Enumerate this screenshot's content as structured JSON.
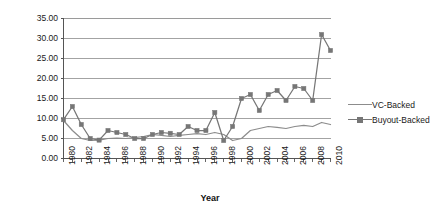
{
  "chart_data": {
    "type": "line",
    "title": "",
    "xlabel": "Year",
    "ylabel": "Median Age at IPO (Yrs)",
    "xlim": [
      1980,
      2010
    ],
    "ylim": [
      0,
      35
    ],
    "ytick_step": 5,
    "xtick_step": 2,
    "grid": "horizontal",
    "legend_position": "right",
    "ytick_labels": [
      "35.00",
      "30.00",
      "25.00",
      "20.00",
      "15.00",
      "10.00",
      "5.00",
      "0.00"
    ],
    "ytick_values": [
      35,
      30,
      25,
      20,
      15,
      10,
      5,
      0
    ],
    "xtick_labels": [
      "1980",
      "1982",
      "1984",
      "1986",
      "1988",
      "1990",
      "1992",
      "1994",
      "1996",
      "1998",
      "2000",
      "2002",
      "2004",
      "2006",
      "2008",
      "2010"
    ],
    "xtick_values": [
      1980,
      1982,
      1984,
      1986,
      1988,
      1990,
      1992,
      1994,
      1996,
      1998,
      2000,
      2002,
      2004,
      2006,
      2008,
      2010
    ],
    "x": [
      1980,
      1981,
      1982,
      1983,
      1984,
      1985,
      1986,
      1987,
      1988,
      1989,
      1990,
      1991,
      1992,
      1993,
      1994,
      1995,
      1996,
      1997,
      1998,
      1999,
      2000,
      2001,
      2002,
      2003,
      2004,
      2005,
      2006,
      2007,
      2008,
      2009,
      2010
    ],
    "series": [
      {
        "name": "VC-Backed",
        "color": "#8c8c8c",
        "marker": "none",
        "values": [
          9.5,
          7.0,
          5.0,
          4.5,
          4.6,
          5.0,
          5.1,
          5.0,
          5.2,
          5.5,
          6.0,
          5.8,
          5.5,
          5.8,
          6.0,
          6.2,
          6.0,
          6.5,
          6.0,
          4.5,
          5.0,
          7.0,
          7.5,
          8.0,
          7.8,
          7.5,
          8.0,
          8.3,
          8.0,
          9.0,
          8.5
        ]
      },
      {
        "name": "Buyout-Backed",
        "color": "#767676",
        "marker": "square",
        "values": [
          9.7,
          13.0,
          8.5,
          5.0,
          4.6,
          7.0,
          6.5,
          6.0,
          5.0,
          5.0,
          6.0,
          6.5,
          6.3,
          6.0,
          8.0,
          7.0,
          7.0,
          11.5,
          4.5,
          8.0,
          15.0,
          16.0,
          12.0,
          16.0,
          17.0,
          14.5,
          18.0,
          17.5,
          14.5,
          31.0,
          27.0
        ]
      }
    ]
  },
  "legend": {
    "items": [
      {
        "label": "VC-Backed"
      },
      {
        "label": "Buyout-Backed"
      }
    ]
  },
  "colors": {
    "axis": "#555555",
    "grid": "#999999",
    "vc_line": "#8c8c8c",
    "buyout_line": "#767676",
    "text": "#1a1a1a",
    "background": "#ffffff"
  }
}
